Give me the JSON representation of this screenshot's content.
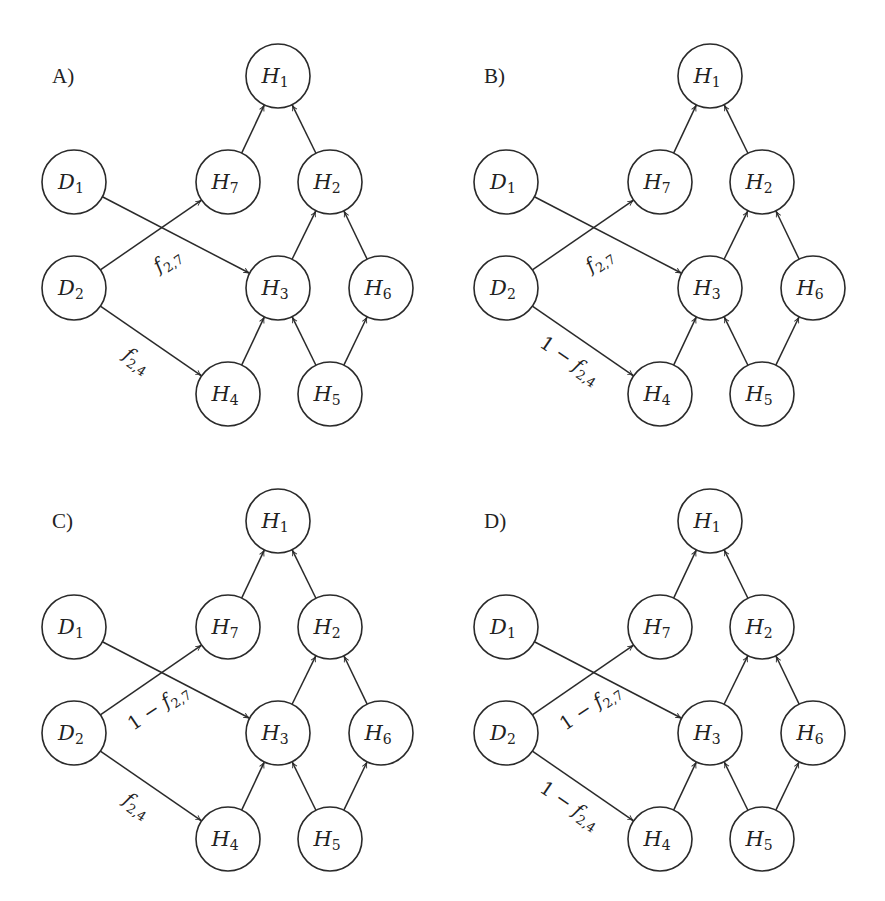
{
  "figure": {
    "node_radius": 32,
    "stroke_color": "#2a2a2a",
    "nodes": [
      {
        "id": "H1",
        "letter": "H",
        "sub": "1",
        "x": 278,
        "y": 76
      },
      {
        "id": "D1",
        "letter": "D",
        "sub": "1",
        "x": 74,
        "y": 182
      },
      {
        "id": "H7",
        "letter": "H",
        "sub": "7",
        "x": 228,
        "y": 182
      },
      {
        "id": "H2",
        "letter": "H",
        "sub": "2",
        "x": 330,
        "y": 182
      },
      {
        "id": "D2",
        "letter": "D",
        "sub": "2",
        "x": 74,
        "y": 288
      },
      {
        "id": "H3",
        "letter": "H",
        "sub": "3",
        "x": 278,
        "y": 288
      },
      {
        "id": "H6",
        "letter": "H",
        "sub": "6",
        "x": 381,
        "y": 288
      },
      {
        "id": "H4",
        "letter": "H",
        "sub": "4",
        "x": 228,
        "y": 394
      },
      {
        "id": "H5",
        "letter": "H",
        "sub": "5",
        "x": 330,
        "y": 394
      }
    ],
    "edges": [
      {
        "from": "H7",
        "to": "H1"
      },
      {
        "from": "H2",
        "to": "H1"
      },
      {
        "from": "D1",
        "to": "H3"
      },
      {
        "from": "D2",
        "to": "H7"
      },
      {
        "from": "D2",
        "to": "H4"
      },
      {
        "from": "H3",
        "to": "H2"
      },
      {
        "from": "H6",
        "to": "H2"
      },
      {
        "from": "H4",
        "to": "H3"
      },
      {
        "from": "H5",
        "to": "H3"
      },
      {
        "from": "H5",
        "to": "H6"
      }
    ],
    "panels": [
      {
        "label": "A)",
        "dx": 0,
        "dy": 0,
        "edge_label_27": {
          "prefix": "",
          "fn": "f",
          "sub": "2,7"
        },
        "edge_label_24": {
          "prefix": "",
          "fn": "f",
          "sub": "2,4"
        }
      },
      {
        "label": "B)",
        "dx": 432,
        "dy": 0,
        "edge_label_27": {
          "prefix": "",
          "fn": "f",
          "sub": "2,7"
        },
        "edge_label_24": {
          "prefix": "1 − ",
          "fn": "f",
          "sub": "2,4"
        }
      },
      {
        "label": "C)",
        "dx": 0,
        "dy": 445,
        "edge_label_27": {
          "prefix": "1 − ",
          "fn": "f",
          "sub": "2,7"
        },
        "edge_label_24": {
          "prefix": "",
          "fn": "f",
          "sub": "2,4"
        }
      },
      {
        "label": "D)",
        "dx": 432,
        "dy": 445,
        "edge_label_27": {
          "prefix": "1 − ",
          "fn": "f",
          "sub": "2,7"
        },
        "edge_label_24": {
          "prefix": "1 − ",
          "fn": "f",
          "sub": "2,4"
        }
      }
    ]
  }
}
